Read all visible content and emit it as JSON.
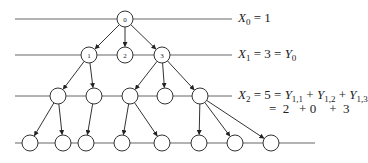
{
  "diagram": {
    "levels": [
      {
        "id": "X0",
        "y": 19,
        "line_x1": 15,
        "line_x2": 232
      },
      {
        "id": "X1",
        "y": 55,
        "line_x1": 15,
        "line_x2": 232
      },
      {
        "id": "X2",
        "y": 96,
        "line_x1": 15,
        "line_x2": 232
      },
      {
        "id": "X3",
        "y": 143,
        "line_x1": 15,
        "line_x2": 315
      }
    ],
    "nodes": [
      {
        "id": "n0",
        "x": 125,
        "y": 19,
        "label": "0"
      },
      {
        "id": "n1",
        "x": 89,
        "y": 55,
        "label": "1"
      },
      {
        "id": "n2",
        "x": 125,
        "y": 55,
        "label": "2"
      },
      {
        "id": "n3",
        "x": 162,
        "y": 55,
        "label": "3"
      },
      {
        "id": "a1",
        "x": 58,
        "y": 96,
        "label": ""
      },
      {
        "id": "a2",
        "x": 94,
        "y": 96,
        "label": ""
      },
      {
        "id": "a3",
        "x": 130,
        "y": 96,
        "label": ""
      },
      {
        "id": "a4",
        "x": 165,
        "y": 96,
        "label": ""
      },
      {
        "id": "a5",
        "x": 200,
        "y": 96,
        "label": ""
      },
      {
        "id": "b1",
        "x": 30,
        "y": 143,
        "label": ""
      },
      {
        "id": "b2",
        "x": 63,
        "y": 143,
        "label": ""
      },
      {
        "id": "b3",
        "x": 86,
        "y": 143,
        "label": ""
      },
      {
        "id": "b4",
        "x": 122,
        "y": 143,
        "label": ""
      },
      {
        "id": "b5",
        "x": 162,
        "y": 143,
        "label": ""
      },
      {
        "id": "b6",
        "x": 199,
        "y": 143,
        "label": ""
      },
      {
        "id": "b7",
        "x": 235,
        "y": 143,
        "label": ""
      },
      {
        "id": "b8",
        "x": 271,
        "y": 143,
        "label": ""
      }
    ],
    "edges": [
      [
        "n0",
        "n1"
      ],
      [
        "n0",
        "n2"
      ],
      [
        "n0",
        "n3"
      ],
      [
        "n1",
        "a1"
      ],
      [
        "n1",
        "a2"
      ],
      [
        "n3",
        "a3"
      ],
      [
        "n3",
        "a4"
      ],
      [
        "n3",
        "a5"
      ],
      [
        "a1",
        "b1"
      ],
      [
        "a1",
        "b2"
      ],
      [
        "a2",
        "b3"
      ],
      [
        "a3",
        "b4"
      ],
      [
        "a3",
        "b5"
      ],
      [
        "a5",
        "b6"
      ],
      [
        "a5",
        "b7"
      ],
      [
        "a5",
        "b8"
      ]
    ],
    "node_radius": 8,
    "stroke_color": "#333333",
    "line_color": "#666666"
  },
  "equations": {
    "x0": {
      "var": "X",
      "sub": "0",
      "rhs": "= 1"
    },
    "x1": {
      "var": "X",
      "sub": "1",
      "mid": "= 3 =",
      "var2": "Y",
      "sub2": "0"
    },
    "x2": {
      "var": "X",
      "sub": "2",
      "mid": "= 5 =",
      "terms": [
        {
          "var": "Y",
          "sub": "1,1"
        },
        {
          "var": "Y",
          "sub": "1,2"
        },
        {
          "var": "Y",
          "sub": "1,3"
        }
      ],
      "plus": "+"
    },
    "x2_values": "=  2   + 0    +  3"
  }
}
